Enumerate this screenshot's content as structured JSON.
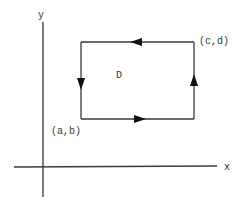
{
  "diagram": {
    "type": "positively-oriented rectangular boundary in the xy-plane",
    "axes": {
      "x_label": "x",
      "y_label": "y"
    },
    "region": {
      "label": "D",
      "corners": {
        "lower_left": "(a,b)",
        "upper_right": "(c,d)"
      }
    },
    "edges": [
      {
        "name": "bottom",
        "direction": "right"
      },
      {
        "name": "right",
        "direction": "up"
      },
      {
        "name": "top",
        "direction": "left"
      },
      {
        "name": "left",
        "direction": "down"
      }
    ],
    "colors": {
      "line": "#3a3a3a",
      "arrowhead": "#111111",
      "text": "#333333",
      "background": "#ffffff"
    }
  }
}
